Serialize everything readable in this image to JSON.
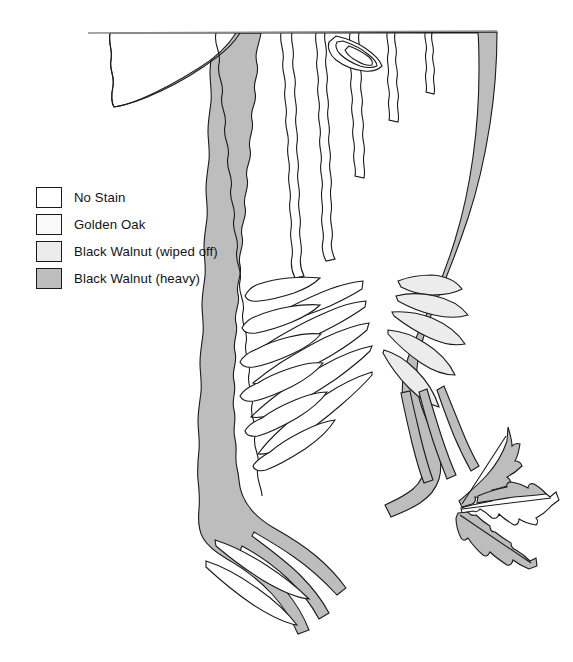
{
  "figure": {
    "background_color": "#ffffff",
    "outline_color": "#1a1a1a"
  },
  "legend": {
    "name": "stain-legend",
    "items": [
      {
        "label": "No Stain",
        "color": "#ffffff",
        "swatch_name": "swatch-no-stain"
      },
      {
        "label": "Golden Oak",
        "color": "#fafafa",
        "swatch_name": "swatch-golden-oak"
      },
      {
        "label": "Black Walnut (wiped off)",
        "color": "#ececec",
        "swatch_name": "swatch-black-walnut-wiped-off"
      },
      {
        "label": "Black Walnut (heavy)",
        "color": "#bdbdbd",
        "swatch_name": "swatch-black-walnut-heavy"
      }
    ]
  },
  "diagram": {
    "top_rule": {
      "name": "top-horizontal-rule",
      "x1": 88,
      "y1": 33,
      "x2": 497,
      "y2": 31
    },
    "regions": [
      {
        "name": "main-figured-panel",
        "fill": "#bdbdbd"
      },
      {
        "name": "upper-left-void",
        "fill": "#ffffff"
      },
      {
        "name": "flame-rays-light",
        "fill": "#ececec"
      },
      {
        "name": "detached-leaf-motif",
        "fill": "#bdbdbd"
      }
    ]
  }
}
